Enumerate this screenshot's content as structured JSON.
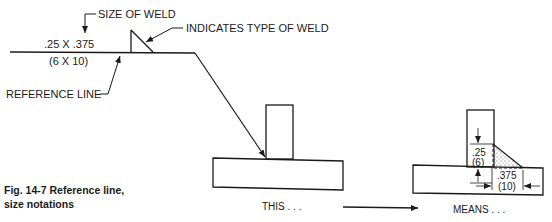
{
  "figure": {
    "caption_line1": "Fig. 14-7  Reference line,",
    "caption_line2": "size notations"
  },
  "callouts": {
    "size_of_weld": "SIZE OF WELD",
    "indicates_type": "INDICATES TYPE OF WELD",
    "reference_line": "REFERENCE LINE"
  },
  "weld_symbol": {
    "size_inch": ".25 X .375",
    "size_mm": "(6 X 10)"
  },
  "left_view": {
    "label": "THIS . . ."
  },
  "right_view": {
    "label": "MEANS . . .",
    "vertical_leg_inch": ".25",
    "vertical_leg_mm": "(6)",
    "horizontal_leg_inch": ".375",
    "horizontal_leg_mm": "(10)"
  },
  "colors": {
    "ink": "#1a1a1a",
    "background": "#ffffff"
  }
}
